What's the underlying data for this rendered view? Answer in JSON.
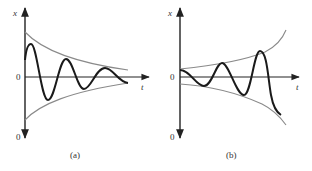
{
  "figure": {
    "panels": [
      {
        "id": "a",
        "caption": "(a)",
        "y_axis_label": "x",
        "x_axis_label": "t",
        "origin_label": "0",
        "bottom_label": "0",
        "description": "Damped oscillation decaying within converging envelope"
      },
      {
        "id": "b",
        "caption": "(b)",
        "y_axis_label": "x",
        "x_axis_label": "t",
        "origin_label": "0",
        "bottom_label": "0",
        "description": "Growing oscillation within diverging envelope"
      }
    ],
    "colors": {
      "axis": "#222222",
      "envelope": "#8a8a8a",
      "curve": "#1a1a1a",
      "text": "#333333"
    }
  }
}
